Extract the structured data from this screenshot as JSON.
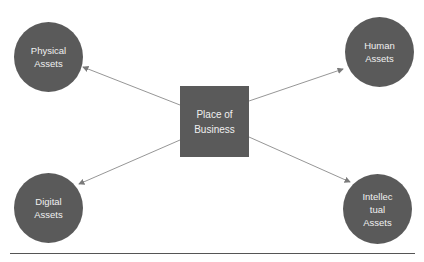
{
  "diagram": {
    "center": {
      "label_lines": [
        "Place of",
        "Business"
      ]
    },
    "nodes": [
      {
        "id": "physical",
        "label_lines": [
          "Physical",
          "Assets"
        ]
      },
      {
        "id": "human",
        "label_lines": [
          "Human",
          "Assets"
        ]
      },
      {
        "id": "digital",
        "label_lines": [
          "Digital",
          "Assets"
        ]
      },
      {
        "id": "intellectual",
        "label_lines": [
          "Intellec",
          "tual",
          "Assets"
        ]
      }
    ],
    "edges": [
      {
        "from": "center",
        "to": "physical"
      },
      {
        "from": "center",
        "to": "human"
      },
      {
        "from": "center",
        "to": "digital"
      },
      {
        "from": "center",
        "to": "intellectual"
      }
    ],
    "colors": {
      "node_fill": "#5a5a5a",
      "node_text": "#f0f0f0",
      "edge": "#8a8a8a",
      "rule": "#555555"
    }
  }
}
